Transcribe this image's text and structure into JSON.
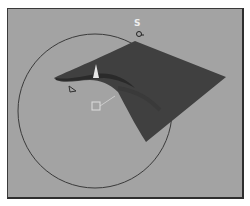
{
  "viewport": {
    "background": "#a3a3a3",
    "border_color": "#2e2e2e"
  },
  "gizmo": {
    "label": "S",
    "circle_color": "#3a3a3a"
  },
  "surface": {
    "color": "#3f3f3f",
    "shadow_color": "#2a2a2a"
  },
  "markers": {
    "cone_icon": "spotlight-cone-icon",
    "arrow_icon": "direction-arrow-icon",
    "target_icon": "target-square-icon",
    "handle_icon": "rotate-handle-icon"
  }
}
